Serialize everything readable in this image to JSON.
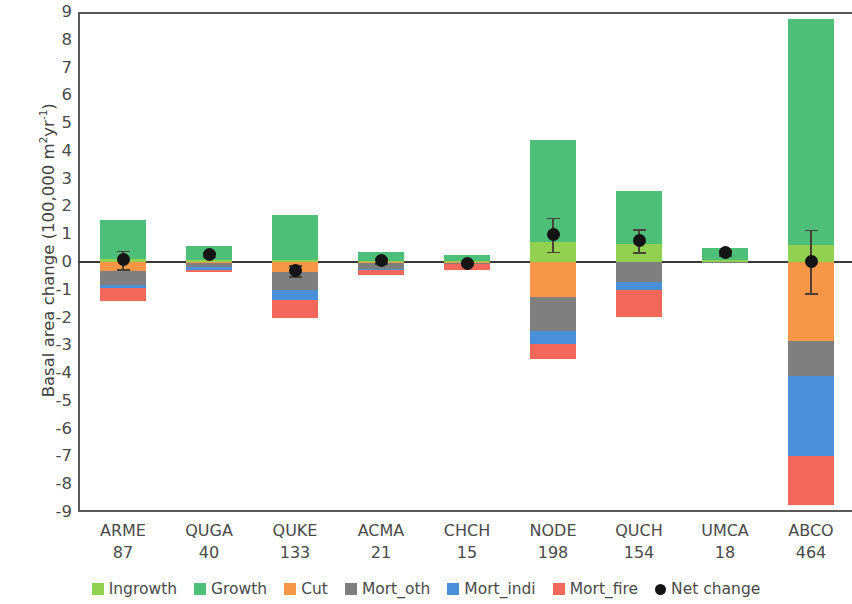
{
  "chart_data": {
    "type": "bar",
    "subtype": "stacked-bar-with-errorbars",
    "title": "",
    "xlabel": "",
    "ylabel": "Basal area change (100,000 m²yr⁻¹)",
    "ylim": [
      -9,
      9
    ],
    "yticks": [
      9,
      8,
      7,
      6,
      5,
      4,
      3,
      2,
      1,
      0,
      -1,
      -2,
      -3,
      -4,
      -5,
      -6,
      -7,
      -8,
      -9
    ],
    "ytick_labels": [
      "9",
      "8",
      "7",
      "6",
      "5",
      "4",
      "3",
      "2",
      "1",
      "0",
      "-1",
      "-2",
      "-3",
      "-4",
      "-5",
      "-6",
      "-7",
      "-8",
      "-9"
    ],
    "grid": false,
    "legend_position": "bottom",
    "categories": [
      "ARME",
      "QUGA",
      "QUKE",
      "ACMA",
      "CHCH",
      "NODE",
      "QUCH",
      "UMCA",
      "ABCO"
    ],
    "category_counts": [
      87,
      40,
      133,
      21,
      15,
      198,
      154,
      18,
      464
    ],
    "series": [
      {
        "name": "Ingrowth",
        "color": "#92d050",
        "values": [
          0.1,
          0.07,
          0.06,
          0.03,
          0.03,
          0.73,
          0.66,
          0.06,
          0.62
        ]
      },
      {
        "name": "Growth",
        "color": "#4ebf79",
        "values": [
          1.4,
          0.51,
          1.64,
          0.33,
          0.22,
          3.67,
          1.89,
          0.45,
          8.13
        ]
      },
      {
        "name": "Cut",
        "color": "#f79646",
        "values": [
          -0.32,
          -0.04,
          -0.36,
          -0.02,
          -0.02,
          -1.27,
          0.0,
          0.0,
          -2.83
        ]
      },
      {
        "name": "Mort_oth",
        "color": "#7f7f7f",
        "values": [
          -0.5,
          -0.14,
          -0.65,
          -0.23,
          -0.04,
          -1.2,
          -0.73,
          -0.01,
          -1.27
        ]
      },
      {
        "name": "Mort_indi",
        "color": "#4a90d9",
        "values": [
          -0.13,
          -0.09,
          -0.36,
          -0.03,
          -0.02,
          -0.47,
          -0.29,
          0.0,
          -2.9
        ]
      },
      {
        "name": "Mort_fire",
        "color": "#f4685c",
        "values": [
          -0.46,
          -0.1,
          -0.65,
          -0.2,
          -0.2,
          -0.55,
          -0.97,
          0.0,
          -1.74
        ]
      }
    ],
    "net_change": {
      "name": "Net change",
      "color": "#141414",
      "values": [
        0.08,
        0.27,
        -0.32,
        0.06,
        -0.04,
        0.98,
        0.77,
        0.33,
        0.02
      ],
      "err_upper": [
        0.33,
        0.08,
        0.2,
        0.1,
        0.06,
        0.61,
        0.41,
        0.09,
        1.15
      ],
      "err_lower": [
        0.33,
        0.08,
        0.2,
        0.1,
        0.06,
        0.61,
        0.41,
        0.09,
        1.15
      ]
    }
  },
  "legend": {
    "items": [
      {
        "label": "Ingrowth",
        "color": "#92d050",
        "marker": "square"
      },
      {
        "label": "Growth",
        "color": "#4ebf79",
        "marker": "square"
      },
      {
        "label": "Cut",
        "color": "#f79646",
        "marker": "square"
      },
      {
        "label": "Mort_oth",
        "color": "#7f7f7f",
        "marker": "square"
      },
      {
        "label": "Mort_indi",
        "color": "#4a90d9",
        "marker": "square"
      },
      {
        "label": "Mort_fire",
        "color": "#f4685c",
        "marker": "square"
      },
      {
        "label": "Net change",
        "color": "#141414",
        "marker": "dot"
      }
    ]
  }
}
